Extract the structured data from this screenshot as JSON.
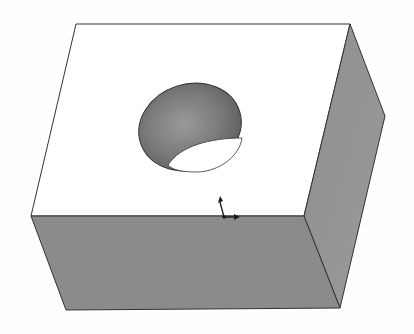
{
  "viewport": {
    "title": "3D Model View",
    "background": "#fefefe"
  },
  "model": {
    "name": "Rectangular block with through hole",
    "faces": {
      "top_color": "#ffffff",
      "front_color": "#8c8c8c",
      "side_color": "#929292",
      "hole_color": "#7e7e7e",
      "edge_color": "#333333"
    }
  },
  "triad": {
    "label": "Coordinate triad",
    "color": "#1a1a1a"
  }
}
